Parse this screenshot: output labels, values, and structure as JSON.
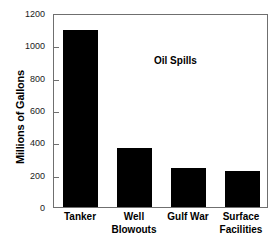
{
  "chart_data": {
    "type": "bar",
    "title": "",
    "annotation": "Oil Spills",
    "xlabel": "",
    "ylabel": "Millions of Gallons",
    "categories": [
      "Tanker",
      "Well Blowouts",
      "Gulf War",
      "Surface Facilities"
    ],
    "category_lines": [
      [
        "Tanker"
      ],
      [
        "Well",
        "Blowouts"
      ],
      [
        "Gulf War"
      ],
      [
        "Surface",
        "Facilities"
      ]
    ],
    "values": [
      1095,
      367,
      242,
      224
    ],
    "ylim": [
      0,
      1200
    ],
    "y_ticks": [
      0,
      200,
      400,
      600,
      800,
      1000,
      1200
    ],
    "y_tick_labels": [
      "0",
      "200",
      "400",
      "600",
      "800",
      "1000",
      "1200"
    ],
    "grid": false,
    "legend": "none",
    "bar_color": "#000000",
    "frame_color": "#6f6f6f",
    "background_color": "#ffffff"
  }
}
